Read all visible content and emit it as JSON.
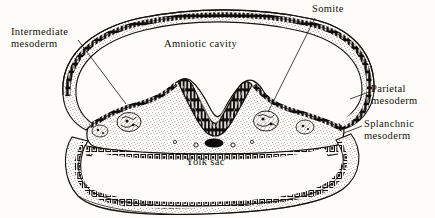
{
  "figure": {
    "background_color": "#fdfcf8",
    "ink_color": "#15120e"
  },
  "labels": {
    "intermediate_line1": "Intermediate",
    "intermediate_line2": "mesoderm",
    "amniotic": "Amniotic cavity",
    "somite": "Somite",
    "parietal_line1": "Parietal",
    "parietal_line2": "mesoderm",
    "splanchnic_line1": "Splanchnic",
    "splanchnic_line2": "mesoderm",
    "yolk": "Yolk sac"
  },
  "structures": [
    {
      "name": "amniotic-cavity",
      "label": "Amniotic cavity"
    },
    {
      "name": "yolk-sac",
      "label": "Yolk sac"
    },
    {
      "name": "somite",
      "label": "Somite"
    },
    {
      "name": "intermediate-mesoderm",
      "label": "Intermediate mesoderm"
    },
    {
      "name": "parietal-mesoderm",
      "label": "Parietal mesoderm"
    },
    {
      "name": "splanchnic-mesoderm",
      "label": "Splanchnic mesoderm"
    },
    {
      "name": "neural-groove",
      "label": ""
    },
    {
      "name": "notochord",
      "label": ""
    }
  ]
}
